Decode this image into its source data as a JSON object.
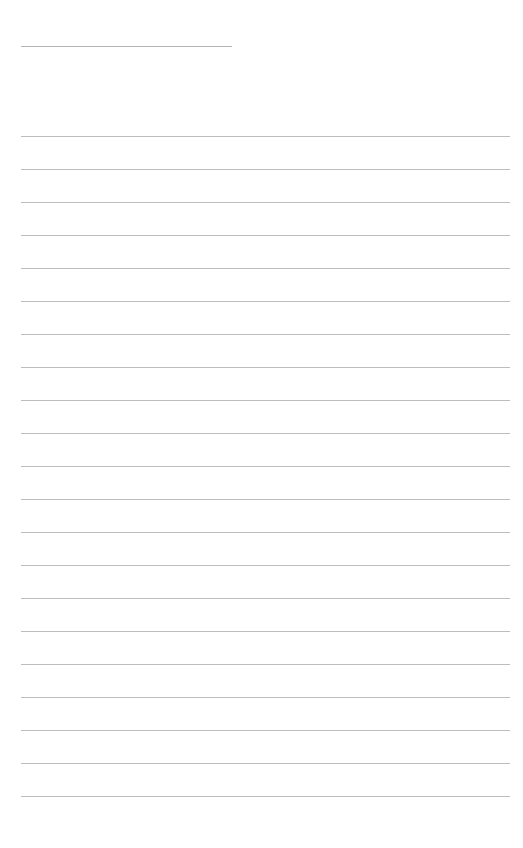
{
  "page": {
    "type": "lined-writing-page",
    "title_field": {
      "value": ""
    },
    "lines": [
      {
        "text": ""
      },
      {
        "text": ""
      },
      {
        "text": ""
      },
      {
        "text": ""
      },
      {
        "text": ""
      },
      {
        "text": ""
      },
      {
        "text": ""
      },
      {
        "text": ""
      },
      {
        "text": ""
      },
      {
        "text": ""
      },
      {
        "text": ""
      },
      {
        "text": ""
      },
      {
        "text": ""
      },
      {
        "text": ""
      },
      {
        "text": ""
      },
      {
        "text": ""
      },
      {
        "text": ""
      },
      {
        "text": ""
      },
      {
        "text": ""
      },
      {
        "text": ""
      },
      {
        "text": ""
      }
    ],
    "colors": {
      "background": "#ffffff",
      "rule_line": "#bdbdbd"
    }
  }
}
